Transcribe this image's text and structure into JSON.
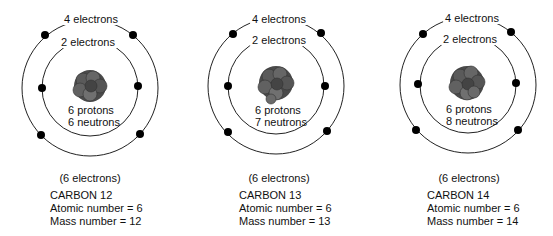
{
  "atoms": [
    {
      "outer_label": "4 electrons",
      "inner_label": "2 electrons",
      "protons": "6 protons",
      "neutrons": "6 neutrons",
      "total": "(6 electrons)",
      "name": "CARBON 12",
      "atomic": "Atomic number  =  6",
      "mass": "Mass number  =  12"
    },
    {
      "outer_label": "4 electrons",
      "inner_label": "2 electrons",
      "protons": "6 protons",
      "neutrons": "7 neutrons",
      "total": "(6 electrons)",
      "name": "CARBON 13",
      "atomic": "Atomic number  =  6",
      "mass": "Mass number  =  13"
    },
    {
      "outer_label": "4 electrons",
      "inner_label": "2 electrons",
      "protons": "6 protons",
      "neutrons": "8 neutrons",
      "total": "(6 electrons)",
      "name": "CARBON 14",
      "atomic": "Atomic number  =  6",
      "mass": "Mass number  =  14"
    }
  ],
  "colors": {
    "line": "#222222",
    "electron": "#000000",
    "nucleus": "#555555"
  }
}
